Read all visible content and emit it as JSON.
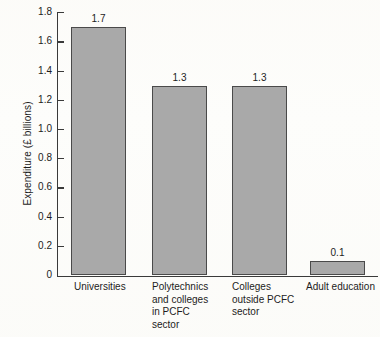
{
  "chart_data": {
    "type": "bar",
    "title": "",
    "subtitle": "",
    "xlabel": "",
    "ylabel": "Expenditure (£ billions)",
    "categories": [
      "Universities",
      "Polytechnics and colleges in PCFC sector",
      "Colleges outside PCFC sector",
      "Adult education"
    ],
    "category_label_lines": [
      "Universities",
      "Polytechnics\nand colleges\nin PCFC\nsector",
      "Colleges\noutside PCFC\nsector",
      "Adult education"
    ],
    "values": [
      1.7,
      1.3,
      1.3,
      0.1
    ],
    "value_labels": [
      "1.7",
      "1.3",
      "1.3",
      "0.1"
    ],
    "ylim": [
      0,
      1.8
    ],
    "ytick_values": [
      0,
      0.2,
      0.4,
      0.6,
      0.8,
      1.0,
      1.2,
      1.4,
      1.6,
      1.8
    ],
    "ytick_labels": [
      "0",
      "0.2",
      "0.4",
      "0.6",
      "0.8",
      "1.0",
      "1.2",
      "1.4",
      "1.6",
      "1.8"
    ],
    "grid": false,
    "legend": false,
    "legend_position": "none",
    "bar_fill_color": "#a9a9a9",
    "bar_edge_color": "#4a4a4a",
    "axis_color": "#3a3a3a",
    "background_color": "#fdfdfb",
    "text_color": "#1c1c1c"
  }
}
